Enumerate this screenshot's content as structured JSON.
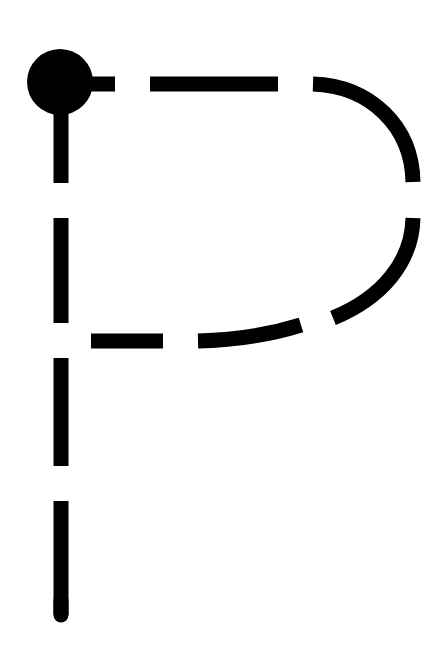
{
  "diagram": {
    "title": "Letter P tracing guide",
    "letter": "P",
    "stroke_color": "#000000",
    "background": "#ffffff",
    "start_dot": {
      "cx": 60,
      "cy": 82,
      "r": 33
    },
    "stroke_width": 15,
    "strokes": [
      {
        "name": "stem",
        "description": "Vertical stroke from start dot down"
      },
      {
        "name": "top-bar",
        "description": "Horizontal stroke right along the top"
      },
      {
        "name": "bowl",
        "description": "Curve around the right side and back to the stem"
      }
    ]
  }
}
